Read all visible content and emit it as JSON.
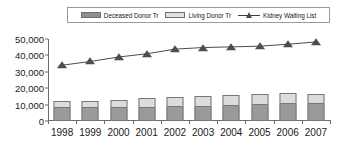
{
  "chart_data": {
    "type": "bar",
    "title": "",
    "subtitle": "",
    "xlabel": "",
    "ylabel": "",
    "categories": [
      "1998",
      "1999",
      "2000",
      "2001",
      "2002",
      "2003",
      "2004",
      "2005",
      "2006",
      "2007"
    ],
    "ylim": [
      0,
      50000
    ],
    "ytick_labels": [
      "50,000",
      "40,000",
      "30,000",
      "20,000",
      "10,000",
      "0"
    ],
    "ytick_values": [
      50000,
      40000,
      30000,
      20000,
      10000,
      0
    ],
    "grid": false,
    "legend_position": "top",
    "stacked": true,
    "series": [
      {
        "name": "Deceased Donor Tr",
        "type": "bar",
        "color": "#9a9a9a",
        "values": [
          8000,
          8100,
          8000,
          8200,
          8500,
          8800,
          9000,
          9900,
          10600,
          10600
        ]
      },
      {
        "name": "Living Donor Tr",
        "type": "bar",
        "color": "#dcdcdc",
        "values": [
          4000,
          4400,
          5000,
          6000,
          5900,
          6300,
          6600,
          6400,
          6400,
          5800
        ]
      },
      {
        "name": "Kidney Waiting List",
        "type": "line",
        "color": "#4d4d4d",
        "marker": "triangle",
        "values": [
          34000,
          36300,
          39000,
          41000,
          43800,
          44800,
          45200,
          45600,
          46800,
          48200
        ]
      }
    ]
  },
  "legend": {
    "items": [
      {
        "label": "Deceased Donor Tr",
        "marker": "filled-square-dark"
      },
      {
        "label": "Living Donor Tr",
        "marker": "filled-square-light"
      },
      {
        "label": "Kidney Waiting List",
        "marker": "line-triangle"
      }
    ]
  }
}
